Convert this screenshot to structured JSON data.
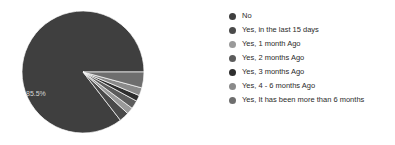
{
  "background_color": "#ffffff",
  "chart_data": {
    "type": "pie",
    "title": "",
    "legend_position": "right",
    "grid": false,
    "labels_shown": [
      "85.5%"
    ],
    "start_angle_deg": 0,
    "direction": "counterclockwise",
    "categories": [
      "No",
      "Yes, in the last 15 days",
      "Yes, 1 month Ago",
      "Yes, 2 months Ago",
      "Yes, 3 months Ago",
      "Yes, 4 - 6 months Ago",
      "Yes, It has been more than 6 months"
    ],
    "values": [
      85.5,
      2.6,
      1.8,
      2.2,
      1.6,
      2.1,
      4.2
    ],
    "colors": [
      "#3f3f3f",
      "#4a4a4a",
      "#9a9a9a",
      "#5c5c5c",
      "#2e2e2e",
      "#8a8a8a",
      "#6e6e6e"
    ],
    "slices": [
      {
        "label": "No",
        "value": 85.5,
        "display": "85.5%",
        "color": "#3f3f3f"
      },
      {
        "label": "Yes, in the last 15 days",
        "value": 2.6,
        "display": "",
        "color": "#4a4a4a"
      },
      {
        "label": "Yes, 1 month Ago",
        "value": 1.8,
        "display": "",
        "color": "#9a9a9a"
      },
      {
        "label": "Yes, 2 months Ago",
        "value": 2.2,
        "display": "",
        "color": "#5c5c5c"
      },
      {
        "label": "Yes, 3 months Ago",
        "value": 1.6,
        "display": "",
        "color": "#2e2e2e"
      },
      {
        "label": "Yes, 4 - 6 months Ago",
        "value": 2.1,
        "display": "",
        "color": "#8a8a8a"
      },
      {
        "label": "Yes, It has been more than 6 months",
        "value": 4.2,
        "display": "",
        "color": "#6e6e6e"
      }
    ]
  },
  "pie": {
    "center_x": 83,
    "center_y": 72,
    "radius": 61,
    "main_label": "85.5%",
    "main_label_x": 26,
    "main_label_y": 96
  },
  "legend": {
    "items": [
      {
        "label": "No",
        "color": "#3f3f3f"
      },
      {
        "label": "Yes, in the last 15 days",
        "color": "#4a4a4a"
      },
      {
        "label": "Yes, 1 month Ago",
        "color": "#9a9a9a"
      },
      {
        "label": "Yes, 2 months Ago",
        "color": "#5c5c5c"
      },
      {
        "label": "Yes, 3 months Ago",
        "color": "#2e2e2e"
      },
      {
        "label": "Yes, 4 - 6 months Ago",
        "color": "#8a8a8a"
      },
      {
        "label": "Yes, It has been more than 6 months",
        "color": "#6e6e6e"
      }
    ]
  }
}
